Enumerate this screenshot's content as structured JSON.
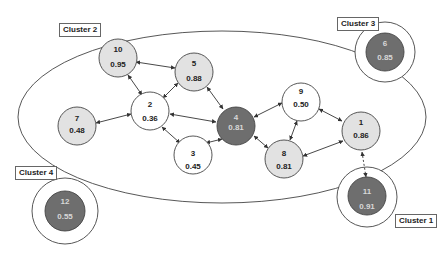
{
  "diagram": {
    "title": "",
    "colors": {
      "white": "#ffffff",
      "light": "#e2e2e2",
      "dark": "#6e6e6e",
      "stroke": "#444444",
      "edge": "#333333"
    },
    "clusters": [
      {
        "id": "cluster1",
        "label": "Cluster 1"
      },
      {
        "id": "cluster2",
        "label": "Cluster 2"
      },
      {
        "id": "cluster3",
        "label": "Cluster 3"
      },
      {
        "id": "cluster4",
        "label": "Cluster 4"
      }
    ],
    "nodes": [
      {
        "id": "1",
        "label": "1",
        "value": "0.86",
        "shade": "light",
        "cluster": "Cluster 2"
      },
      {
        "id": "2",
        "label": "2",
        "value": "0.36",
        "shade": "white",
        "cluster": "Cluster 2"
      },
      {
        "id": "3",
        "label": "3",
        "value": "0.45",
        "shade": "white",
        "cluster": "Cluster 2"
      },
      {
        "id": "4",
        "label": "4",
        "value": "0.81",
        "shade": "dark",
        "cluster": "Cluster 2"
      },
      {
        "id": "5",
        "label": "5",
        "value": "0.88",
        "shade": "light",
        "cluster": "Cluster 2"
      },
      {
        "id": "6",
        "label": "6",
        "value": "0.85",
        "shade": "dark",
        "cluster": "Cluster 3"
      },
      {
        "id": "7",
        "label": "7",
        "value": "0.48",
        "shade": "light",
        "cluster": "Cluster 2"
      },
      {
        "id": "8",
        "label": "8",
        "value": "0.81",
        "shade": "light",
        "cluster": "Cluster 2"
      },
      {
        "id": "9",
        "label": "9",
        "value": "0.50",
        "shade": "white",
        "cluster": "Cluster 2"
      },
      {
        "id": "10",
        "label": "10",
        "value": "0.95",
        "shade": "light",
        "cluster": "Cluster 2"
      },
      {
        "id": "11",
        "label": "11",
        "value": "0.91",
        "shade": "dark",
        "cluster": "Cluster 1"
      },
      {
        "id": "12",
        "label": "12",
        "value": "0.55",
        "shade": "dark",
        "cluster": "Cluster 4"
      }
    ],
    "edges": [
      {
        "from": "10",
        "to": "5",
        "style": "solid"
      },
      {
        "from": "10",
        "to": "2",
        "style": "solid"
      },
      {
        "from": "5",
        "to": "2",
        "style": "solid"
      },
      {
        "from": "5",
        "to": "4",
        "style": "solid"
      },
      {
        "from": "7",
        "to": "2",
        "style": "solid"
      },
      {
        "from": "2",
        "to": "4",
        "style": "solid"
      },
      {
        "from": "2",
        "to": "3",
        "style": "solid"
      },
      {
        "from": "3",
        "to": "4",
        "style": "solid"
      },
      {
        "from": "4",
        "to": "9",
        "style": "solid"
      },
      {
        "from": "4",
        "to": "8",
        "style": "solid"
      },
      {
        "from": "9",
        "to": "8",
        "style": "solid"
      },
      {
        "from": "9",
        "to": "1",
        "style": "solid"
      },
      {
        "from": "8",
        "to": "1",
        "style": "solid"
      },
      {
        "from": "1",
        "to": "11",
        "style": "dashed"
      }
    ]
  }
}
